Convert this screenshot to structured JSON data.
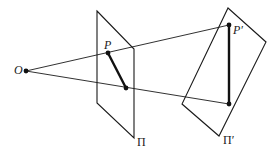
{
  "diagram": {
    "type": "perspective-projection",
    "labels": {
      "center": "O",
      "point_original": "P",
      "point_projected": "P′",
      "plane_original": "Π",
      "plane_projected": "Π′"
    },
    "points": {
      "O": [
        26,
        71
      ],
      "P": [
        108,
        53
      ],
      "Q": [
        126,
        88
      ],
      "P_prime": [
        229,
        25
      ],
      "Q_prime": [
        229,
        104
      ]
    },
    "planes": {
      "Pi": [
        [
          97,
          11
        ],
        [
          134,
          49
        ],
        [
          134,
          138
        ],
        [
          97,
          103
        ]
      ],
      "Pi_prime": [
        [
          228,
          8
        ],
        [
          266,
          42
        ],
        [
          219,
          136
        ],
        [
          182,
          104
        ]
      ]
    },
    "colors": {
      "stroke": "#1a1a1a",
      "background": "#ffffff"
    }
  }
}
